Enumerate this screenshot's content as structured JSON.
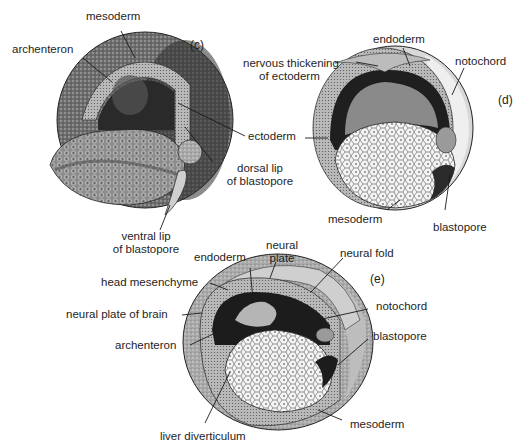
{
  "figure": {
    "panels": [
      {
        "id": "c",
        "tag": "(c)",
        "labels": {
          "mesoderm": "mesoderm",
          "archenteron": "archenteron",
          "ectoderm": "ectoderm",
          "dorsal_lip_1": "dorsal lip",
          "dorsal_lip_2": "of blastopore",
          "ventral_lip_1": "ventral lip",
          "ventral_lip_2": "of blastopore"
        }
      },
      {
        "id": "d",
        "tag": "(d)",
        "labels": {
          "endoderm": "endoderm",
          "nervous_thickening_1": "nervous thickening",
          "nervous_thickening_2": "of ectoderm",
          "notochord": "notochord",
          "mesoderm": "mesoderm",
          "blastopore": "blastopore"
        }
      },
      {
        "id": "e",
        "tag": "(e)",
        "labels": {
          "endoderm": "endoderm",
          "neural_plate_1": "neural",
          "neural_plate_2": "plate",
          "neural_fold": "neural fold",
          "head_mesenchyme": "head mesenchyme",
          "neural_plate_of_brain": "neural plate of brain",
          "archenteron": "archenteron",
          "notochord": "notochord",
          "blastopore": "blastopore",
          "mesoderm": "mesoderm",
          "liver_diverticulum": "liver diverticulum"
        }
      }
    ],
    "colors": {
      "ink": "#1a1a1a",
      "dark_fill": "#3a3a3a",
      "mid_fill": "#8a8a8a",
      "light_fill": "#d9d9d9",
      "yolk_fill": "#f2f2f2"
    }
  }
}
